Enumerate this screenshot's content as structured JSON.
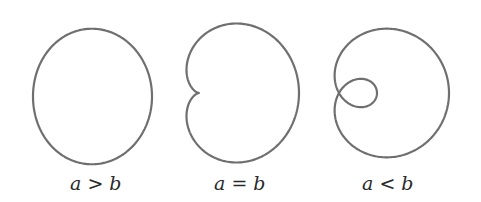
{
  "figure": {
    "stroke_color": "#6f6f6f",
    "panels": [
      {
        "id": "a-gt-b",
        "label_a": "a",
        "op": ">",
        "label_b": "b",
        "a": 59.5,
        "b": 14,
        "ox": 78.5,
        "oy": 96.5,
        "sy": 1.11,
        "left": 70
      },
      {
        "id": "a-eq-b",
        "label_a": "a",
        "op": "=",
        "label_b": "b",
        "a": 50,
        "b": 50,
        "ox": 199,
        "oy": 93,
        "sy": 1.07,
        "left": 214
      },
      {
        "id": "a-lt-b",
        "label_a": "a",
        "op": "<",
        "label_b": "b",
        "a": 36,
        "b": 74,
        "ox": 339,
        "oy": 93,
        "sy": 1.0,
        "left": 362
      }
    ]
  }
}
